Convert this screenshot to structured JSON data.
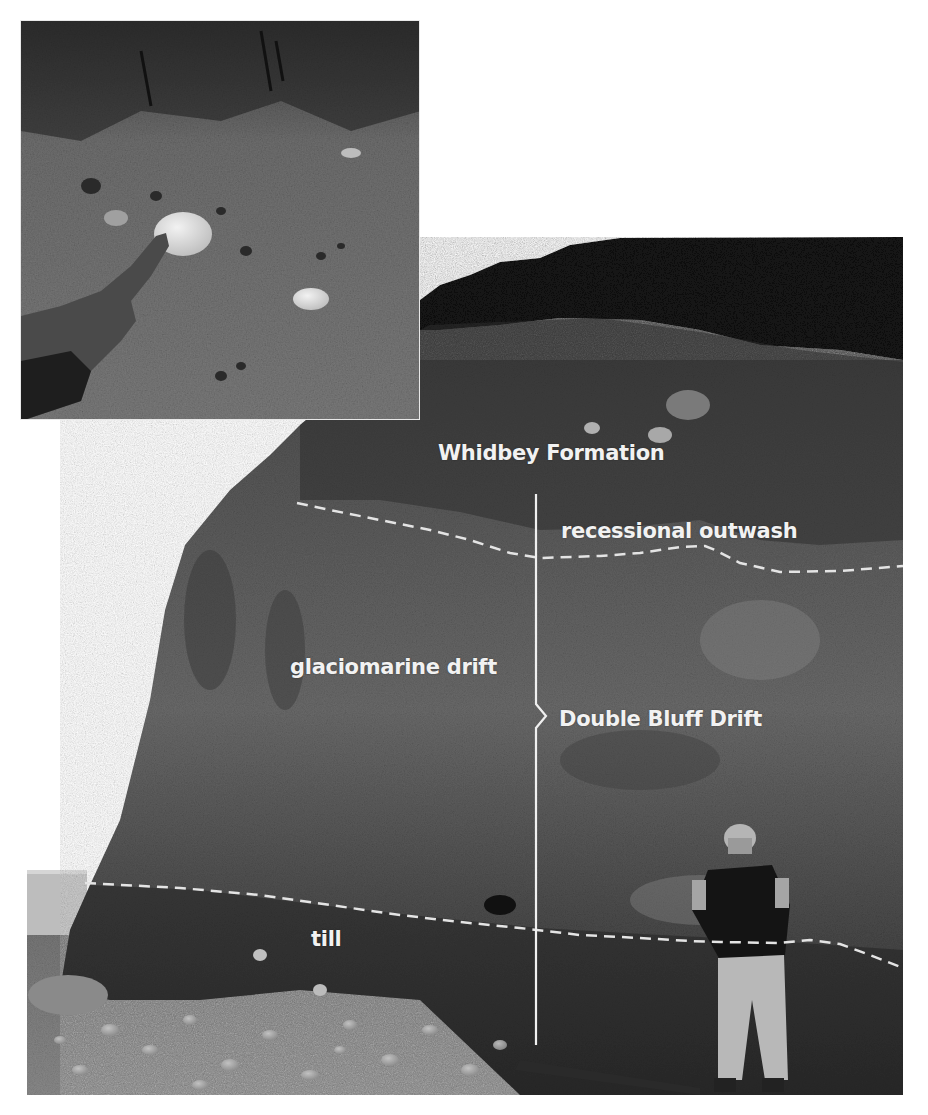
{
  "figure": {
    "main_photo": {
      "labels": {
        "whidbey": "Whidbey Formation",
        "outwash": "recessional outwash",
        "glaciomarine": "glaciomarine drift",
        "double_bluff": "Double Bluff Drift",
        "till": "till"
      },
      "subjects": [
        "coastal bluff",
        "person standing with backpack",
        "cobble beach",
        "vegetation on bluff top"
      ],
      "annotation_color": "#f2f2f2"
    },
    "inset_photo": {
      "subjects": [
        "hand pointing at pale clast",
        "gravelly sediment"
      ]
    }
  }
}
